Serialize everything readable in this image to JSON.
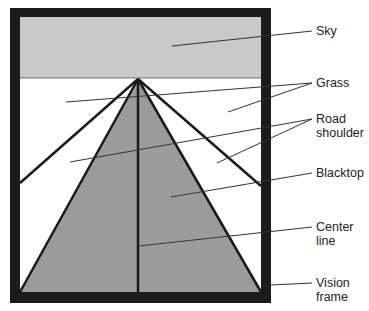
{
  "diagram": {
    "colors": {
      "frame": "#1c1c1c",
      "sky": "#c9c9c9",
      "grass": "#ffffff",
      "blacktop": "#9b9b9b",
      "lines": "#1a1a1a",
      "leader": "#333333"
    },
    "labels": {
      "sky": "Sky",
      "grass": "Grass",
      "road_shoulder": "Road\nshoulder",
      "blacktop": "Blacktop",
      "center_line": "Center\nline",
      "vision_frame": "Vision\nframe"
    }
  }
}
